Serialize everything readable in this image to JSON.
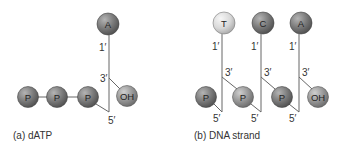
{
  "panel_a": {
    "caption": "(a) dATP",
    "base": "A",
    "prime_1": "1′",
    "prime_3": "3′",
    "prime_5": "5′",
    "hydroxyl": "OH",
    "phosphates": [
      "P",
      "P",
      "P"
    ]
  },
  "panel_b": {
    "caption": "(b) DNA strand",
    "nucleotides": [
      {
        "base": "T",
        "prime_1": "1′",
        "prime_3": "3′",
        "prime_5": "5′",
        "phosphate": "P"
      },
      {
        "base": "C",
        "prime_1": "1′",
        "prime_3": "3′",
        "prime_5": "5′",
        "phosphate": "P"
      },
      {
        "base": "A",
        "prime_1": "1′",
        "prime_3": "3′",
        "prime_5": "5′",
        "phosphate": "P"
      }
    ],
    "terminal_phosphate": "P",
    "hydroxyl": "OH"
  },
  "colors": {
    "dark_sphere": "#6e6e6e",
    "mid_sphere": "#8a8a8a",
    "light_sphere": "#d6d6d6",
    "line": "#555555"
  }
}
